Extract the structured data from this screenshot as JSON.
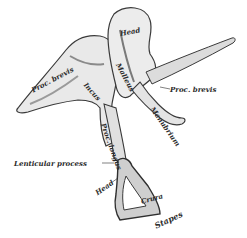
{
  "figure": {
    "bones": [
      {
        "name": "Malleus",
        "parts": [
          "Head",
          "Proc. brevis",
          "Manubrium"
        ]
      },
      {
        "name": "Incus",
        "parts": [
          "Proc. brevis",
          "Proc. longus",
          "Lenticular process"
        ]
      },
      {
        "name": "Stapes",
        "parts": [
          "Head",
          "Crura"
        ]
      }
    ]
  },
  "labels": {
    "head_malleus": "Head",
    "malleus": "Malleus",
    "incus": "Incus",
    "proc_brevis_incus": "Proc. brevis",
    "proc_brevis_malleus": "Proc. brevis",
    "manubrium": "Manubrium",
    "proc_longus": "Proc. longus",
    "lenticular_process": "Lenticular process",
    "head_stapes": "Head",
    "crura": "Crura",
    "stapes": "Stapes"
  },
  "colors": {
    "ink": "#2b2b2b",
    "shade": "#8a8a8a",
    "light": "#d9d9d9",
    "background": "#ffffff"
  }
}
